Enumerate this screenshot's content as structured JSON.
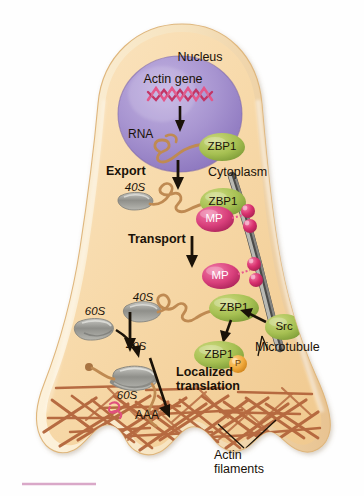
{
  "figure": {
    "kind": "cell-biology-diagram",
    "background_color": "#ffffff"
  },
  "colors": {
    "cell_fill": "#f6d9ac",
    "cell_fill_light": "#fbe8c8",
    "cell_membrane": "#f7eacb",
    "cell_membrane_edge": "#e2b878",
    "nucleus": "#9b87c9",
    "nucleus_light": "#b9a8dc",
    "dna_pink": "#e0527f",
    "rna_brown": "#c08a52",
    "zbp1_green": "#9fbf4d",
    "src_green": "#8fb84a",
    "motor_protein_pink": "#d9407c",
    "vesicle_pink": "#d93b74",
    "ribosome_gray": "#9a9a96",
    "microtubule_gray": "#6f6f6f",
    "actin_brown": "#b5663d",
    "phosphate_orange": "#f0a93b",
    "text_dark": "#1a1208",
    "footer_rule": "#d9a8c8"
  },
  "nucleus": {
    "title": "Nucleus",
    "gene_label": "Actin gene",
    "rna_label": "RNA",
    "binding_protein": "ZBP1"
  },
  "steps": [
    {
      "id": "export",
      "label": "Export"
    },
    {
      "id": "transport",
      "label": "Transport"
    },
    {
      "id": "localized_translation",
      "label": "Localized\ntranslation",
      "line1": "Localized",
      "line2": "translation"
    }
  ],
  "compartments": {
    "cytoplasm": "Cytoplasm"
  },
  "ribosome_subunits": {
    "small_top": "40S",
    "small_mid": "40S",
    "small_bottom": "40S",
    "large_mid": "60S",
    "large_bottom": "60S"
  },
  "proteins": {
    "zbp1_nucleus": "ZBP1",
    "zbp1_export": "ZBP1",
    "zbp1_free": "ZBP1",
    "zbp1_phospho": "ZBP1",
    "phosphate_badge": "P",
    "src_kinase": "Src",
    "motor_protein": "MP"
  },
  "cytoskeleton": {
    "microtubule": "Microtubule",
    "actin_line1": "Actin",
    "actin_line2": "filaments"
  },
  "mrna": {
    "polyA_tail": "AAA"
  },
  "icons": {
    "arrow_transcription": "arrow-down-icon",
    "arrow_export": "arrow-down-icon",
    "arrow_transport": "arrow-down-icon",
    "arrow_subunit_join": "arrow-down-icon",
    "arrow_60s_join": "arrow-curve-icon",
    "arrow_src": "arrow-left-icon",
    "arrow_phospho": "arrow-down-icon",
    "arrow_translation": "arrow-diagonal-icon",
    "leader_microtubule": "leader-line-icon",
    "leader_actin": "leader-line-icon"
  }
}
